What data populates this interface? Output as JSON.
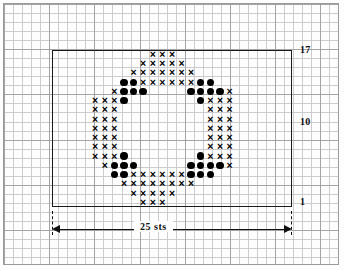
{
  "chart_data": {
    "type": "table",
    "stitch_count": 25,
    "row_count": 17,
    "row_labels_visible": [
      "17",
      "10",
      "1"
    ],
    "width_label": "25 sts",
    "symbols": {
      "x": "cross-stitch-symbol",
      "o": "dot-symbol",
      "blank": "empty-stitch"
    },
    "legend": [
      {
        "symbol": "x",
        "name": "cross-stitch-symbol"
      },
      {
        "symbol": "o",
        "name": "dot-symbol"
      }
    ],
    "xlabel": "25 sts",
    "ylabel": "",
    "grid": true,
    "rows": [
      {
        "row": 17,
        "cells": [
          "",
          "",
          "",
          "",
          "",
          "",
          "",
          "",
          "",
          "",
          "x",
          "x",
          "x",
          "",
          "",
          "",
          "",
          "",
          "",
          "",
          "",
          "",
          "",
          "",
          ""
        ]
      },
      {
        "row": 16,
        "cells": [
          "",
          "",
          "",
          "",
          "",
          "",
          "",
          "",
          "",
          "x",
          "x",
          "x",
          "x",
          "x",
          "",
          "",
          "",
          "",
          "",
          "",
          "",
          "",
          "",
          "",
          ""
        ]
      },
      {
        "row": 15,
        "cells": [
          "",
          "",
          "",
          "",
          "",
          "",
          "",
          "",
          "x",
          "x",
          "x",
          "x",
          "x",
          "x",
          "x",
          "",
          "",
          "",
          "",
          "",
          "",
          "",
          "",
          "",
          ""
        ]
      },
      {
        "row": 14,
        "cells": [
          "",
          "",
          "",
          "",
          "",
          "",
          "",
          "o",
          "o",
          "x",
          "x",
          "x",
          "x",
          "x",
          "x",
          "o",
          "o",
          "",
          "",
          "",
          "",
          "",
          "",
          "",
          ""
        ]
      },
      {
        "row": 13,
        "cells": [
          "",
          "",
          "",
          "",
          "",
          "",
          "x",
          "o",
          "o",
          "o",
          "",
          "",
          "",
          "",
          "o",
          "o",
          "o",
          "o",
          "x",
          "",
          "",
          "",
          "",
          "",
          ""
        ]
      },
      {
        "row": 12,
        "cells": [
          "",
          "",
          "",
          "",
          "x",
          "x",
          "x",
          "o",
          "",
          "",
          "",
          "",
          "",
          "",
          "",
          "o",
          "x",
          "x",
          "x",
          "",
          "",
          "",
          "",
          "",
          ""
        ]
      },
      {
        "row": 11,
        "cells": [
          "",
          "",
          "",
          "",
          "x",
          "x",
          "x",
          "",
          "",
          "",
          "",
          "",
          "",
          "",
          "",
          "",
          "x",
          "x",
          "x",
          "",
          "",
          "",
          "",
          "",
          ""
        ]
      },
      {
        "row": 10,
        "cells": [
          "",
          "",
          "",
          "",
          "x",
          "x",
          "x",
          "",
          "",
          "",
          "",
          "",
          "",
          "",
          "",
          "",
          "x",
          "x",
          "x",
          "",
          "",
          "",
          "",
          "",
          ""
        ]
      },
      {
        "row": 9,
        "cells": [
          "",
          "",
          "",
          "",
          "x",
          "x",
          "x",
          "",
          "",
          "",
          "",
          "",
          "",
          "",
          "",
          "",
          "x",
          "x",
          "x",
          "",
          "",
          "",
          "",
          "",
          ""
        ]
      },
      {
        "row": 8,
        "cells": [
          "",
          "",
          "",
          "",
          "x",
          "x",
          "x",
          "",
          "",
          "",
          "",
          "",
          "",
          "",
          "",
          "",
          "x",
          "x",
          "x",
          "",
          "",
          "",
          "",
          "",
          ""
        ]
      },
      {
        "row": 7,
        "cells": [
          "",
          "",
          "",
          "",
          "x",
          "x",
          "x",
          "",
          "",
          "",
          "",
          "",
          "",
          "",
          "",
          "",
          "x",
          "x",
          "x",
          "",
          "",
          "",
          "",
          "",
          ""
        ]
      },
      {
        "row": 6,
        "cells": [
          "",
          "",
          "",
          "",
          "x",
          "x",
          "x",
          "o",
          "",
          "",
          "",
          "",
          "",
          "",
          "",
          "o",
          "x",
          "x",
          "x",
          "",
          "",
          "",
          "",
          "",
          ""
        ]
      },
      {
        "row": 5,
        "cells": [
          "",
          "",
          "",
          "",
          "",
          "x",
          "o",
          "o",
          "o",
          "",
          "",
          "",
          "",
          "",
          "o",
          "o",
          "o",
          "o",
          "x",
          "",
          "",
          "",
          "",
          "",
          ""
        ]
      },
      {
        "row": 4,
        "cells": [
          "",
          "",
          "",
          "",
          "",
          "",
          "o",
          "o",
          "x",
          "x",
          "x",
          "x",
          "x",
          "x",
          "o",
          "o",
          "o",
          "",
          "",
          "",
          "",
          "",
          "",
          "",
          ""
        ]
      },
      {
        "row": 3,
        "cells": [
          "",
          "",
          "",
          "",
          "",
          "",
          "",
          "x",
          "x",
          "x",
          "x",
          "x",
          "x",
          "x",
          "x",
          "",
          "",
          "",
          "",
          "",
          "",
          "",
          "",
          "",
          ""
        ]
      },
      {
        "row": 2,
        "cells": [
          "",
          "",
          "",
          "",
          "",
          "",
          "",
          "",
          "x",
          "x",
          "x",
          "x",
          "x",
          "",
          "",
          "",
          "",
          "",
          "",
          "",
          "",
          "",
          "",
          "",
          ""
        ]
      },
      {
        "row": 1,
        "cells": [
          "",
          "",
          "",
          "",
          "",
          "",
          "",
          "",
          "",
          "x",
          "x",
          "x",
          "",
          "",
          "",
          "",
          "",
          "",
          "",
          "",
          "",
          "",
          "",
          "",
          ""
        ]
      }
    ]
  },
  "labels": {
    "top_row": "17",
    "mid_row": "10",
    "bottom_row": "1",
    "width": "25 sts"
  },
  "colors": {
    "symbol": "#000000",
    "chart_border": "#1a1a1a",
    "grid_minor": "#c4c4c8",
    "grid_major": "#96969b",
    "page_background": "#fdfdfd"
  }
}
